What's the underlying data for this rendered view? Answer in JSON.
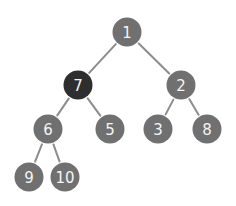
{
  "diagram": {
    "type": "binary-tree",
    "colors": {
      "node": "#707070",
      "highlighted_node": "#2e2e2e",
      "edge": "#8c8c8c",
      "label": "#f4f4f4"
    },
    "nodes": [
      {
        "id": "n1",
        "label": "1",
        "highlighted": false
      },
      {
        "id": "n7",
        "label": "7",
        "highlighted": true
      },
      {
        "id": "n2",
        "label": "2",
        "highlighted": false
      },
      {
        "id": "n6",
        "label": "6",
        "highlighted": false
      },
      {
        "id": "n5",
        "label": "5",
        "highlighted": false
      },
      {
        "id": "n3",
        "label": "3",
        "highlighted": false
      },
      {
        "id": "n8",
        "label": "8",
        "highlighted": false
      },
      {
        "id": "n9",
        "label": "9",
        "highlighted": false
      },
      {
        "id": "n10",
        "label": "10",
        "highlighted": false
      }
    ],
    "edges": [
      {
        "from": "n1",
        "to": "n7"
      },
      {
        "from": "n1",
        "to": "n2"
      },
      {
        "from": "n7",
        "to": "n6"
      },
      {
        "from": "n7",
        "to": "n5"
      },
      {
        "from": "n2",
        "to": "n3"
      },
      {
        "from": "n2",
        "to": "n8"
      },
      {
        "from": "n6",
        "to": "n9"
      },
      {
        "from": "n6",
        "to": "n10"
      }
    ]
  }
}
